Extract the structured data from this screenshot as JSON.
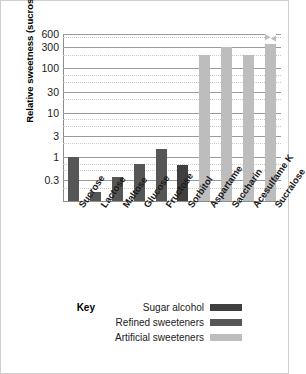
{
  "chart_data": {
    "type": "bar",
    "title": "",
    "xlabel": "",
    "ylabel": "Relative sweetness (sucrose = 1)",
    "yscale": "log",
    "ylim": [
      0.1,
      600
    ],
    "grid": true,
    "legend_position": "bottom",
    "categories": [
      "Sucrose",
      "Lactose",
      "Maltose",
      "Glucose",
      "Fructose",
      "Sorbitol",
      "Aspartame",
      "Saccharin",
      "Acesulfame K",
      "Sucralose"
    ],
    "values": [
      1,
      0.16,
      0.35,
      0.7,
      1.5,
      0.65,
      200,
      300,
      200,
      600
    ],
    "value_notes": [
      "",
      "",
      "",
      "",
      "",
      "",
      "",
      "",
      "",
      "axis break: extends above 600"
    ],
    "bar_groups": [
      "Refined sweeteners",
      "Refined sweeteners",
      "Refined sweeteners",
      "Refined sweeteners",
      "Refined sweeteners",
      "Sugar alcohol",
      "Artificial sweeteners",
      "Artificial sweeteners",
      "Artificial sweeteners",
      "Artificial sweeteners"
    ],
    "ytick_labels": [
      "600",
      "300",
      "100",
      "30",
      "10",
      "3",
      "1",
      "0.3"
    ],
    "ytick_values": [
      600,
      300,
      100,
      30,
      10,
      3,
      1,
      0.3
    ],
    "colors": {
      "sugar_alcohol": "#3f3f3f",
      "refined_sweeteners": "#565656",
      "artificial_sweeteners": "#bdbdbd",
      "gridline_major": "#9a9a9a",
      "gridline_minor": "#c9c9c9",
      "axis": "#8d8d8d",
      "text": "#1a1a1a",
      "background": "#ffffff"
    },
    "legend": {
      "key_label": "Key",
      "entries": [
        {
          "label": "Sugar alcohol",
          "color": "#3f3f3f"
        },
        {
          "label": "Refined sweeteners",
          "color": "#565656"
        },
        {
          "label": "Artificial sweeteners",
          "color": "#bdbdbd"
        }
      ]
    }
  }
}
